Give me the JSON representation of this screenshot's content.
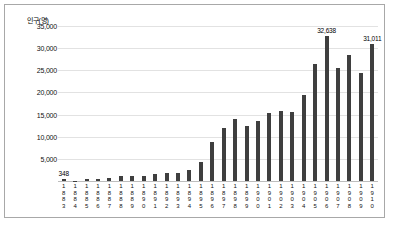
{
  "chart_data": {
    "type": "bar",
    "title": "",
    "subtitle": "",
    "xlabel": "",
    "ylabel": "인구(명)",
    "ylim": [
      0,
      35000
    ],
    "ytick_labels": [
      "35,000",
      "30,000",
      "25,000",
      "20,000",
      "15,000",
      "10,000",
      "5,000"
    ],
    "ytick_values": [
      35000,
      30000,
      25000,
      20000,
      15000,
      10000,
      5000
    ],
    "grid": true,
    "legend": null,
    "categories": [
      "1883",
      "1884",
      "1885",
      "1886",
      "1887",
      "1888",
      "1889",
      "1890",
      "1891",
      "1892",
      "1893",
      "1894",
      "1895",
      "1896",
      "1897",
      "1898",
      "1899",
      "1900",
      "1901",
      "1902",
      "1903",
      "1904",
      "1905",
      "1906",
      "1907",
      "1908",
      "1909",
      "1910"
    ],
    "values": [
      348,
      90,
      407,
      562,
      680,
      1030,
      1100,
      1200,
      1650,
      1700,
      1750,
      2400,
      4400,
      8700,
      12000,
      14000,
      12500,
      13500,
      15300,
      15800,
      15500,
      19500,
      26500,
      32638,
      25500,
      28500,
      24500,
      31011
    ],
    "annotations": [
      {
        "category": "1883",
        "value": 348,
        "label": "348"
      },
      {
        "category": "1906",
        "value": 32638,
        "label": "32,638"
      },
      {
        "category": "1910",
        "value": 31011,
        "label": "31,011"
      }
    ],
    "colors": {
      "bar": "#3f3f3f",
      "gridline": "#e2e2e2",
      "axis": "#bdbdbd",
      "text": "#111111",
      "frame": "#a8a8a8",
      "background": "#ffffff"
    }
  }
}
